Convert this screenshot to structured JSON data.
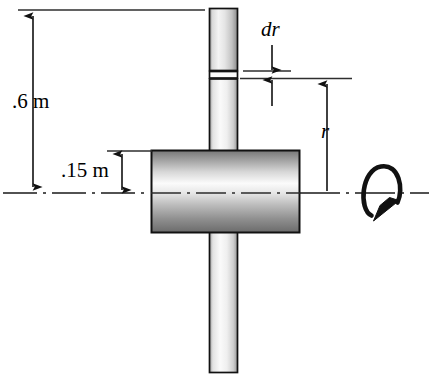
{
  "figure": {
    "width": 430,
    "height": 384,
    "background_color": "#ffffff",
    "line_color": "#1a1a1a"
  },
  "labels": {
    "bar_half_length": ".6 m",
    "hub_radius": ".15 m",
    "differential_element": "dr",
    "radius_variable": "r"
  },
  "geometry": {
    "bar": {
      "name": "vertical-bar",
      "x": 209,
      "y": 8,
      "width": 29,
      "height": 365,
      "fill_light": "#f2f2f2",
      "fill_mid": "#d0d0d0",
      "fill_dark": "#9a9a9a",
      "stroke": "#111111"
    },
    "hub": {
      "name": "cylindrical-hub",
      "x": 151,
      "y": 150,
      "width": 149,
      "height": 83,
      "fill_light": "#fbfbfb",
      "fill_mid": "#b8b8b8",
      "fill_dark": "#6f6f6f",
      "stroke": "#111111"
    },
    "axis_of_rotation": {
      "name": "centerline",
      "y": 193,
      "x_start": 3,
      "x_end": 430,
      "dash_pattern": "18 5 3 5"
    },
    "dr_band": {
      "name": "dr-strip",
      "y_top": 71,
      "y_bottom": 78
    }
  },
  "dimensions": {
    "length_dimension": {
      "name": "dimension-06m",
      "x": 33,
      "y_top": 10,
      "y_bottom": 193,
      "extension_top_x1": 18,
      "extension_top_x2": 205,
      "value": ".6 m"
    },
    "hub_radius_dimension": {
      "name": "dimension-015m",
      "x": 122,
      "y_top": 151,
      "y_bottom": 193,
      "extension_x1": 107,
      "extension_x2": 152,
      "value": ".15 m"
    },
    "dr_dimension": {
      "name": "dimension-dr",
      "x": 272,
      "arrow_down_from_y": 44,
      "arrow_down_to_y": 70,
      "arrow_up_from_y": 104,
      "arrow_up_to_y": 79,
      "value": "dr"
    },
    "r_dimension": {
      "name": "dimension-r",
      "x": 327,
      "y_top": 79,
      "y_bottom": 193,
      "extension_x1": 240,
      "extension_x2": 352,
      "value": "r"
    }
  },
  "rotation_indicator": {
    "name": "rotation-arrow",
    "center_x": 381,
    "center_y": 193,
    "rx": 19,
    "ry": 27,
    "direction": "counter-clockwise-about-axis",
    "stroke_width": 4.5
  }
}
